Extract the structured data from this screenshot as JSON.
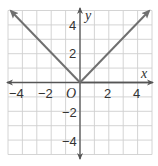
{
  "chart_data": {
    "type": "line",
    "title": "",
    "xlabel": "x",
    "ylabel": "y",
    "origin_label": "O",
    "xlim": [
      -5,
      5
    ],
    "ylim": [
      -5,
      5
    ],
    "grid": true,
    "x_ticks": [
      -4,
      -2,
      2,
      4
    ],
    "y_ticks": [
      4,
      2,
      -2,
      -4
    ],
    "x_tick_labels": [
      "−4",
      "−2",
      "2",
      "4"
    ],
    "y_tick_labels": [
      "4",
      "2",
      "−2",
      "−4"
    ],
    "series": [
      {
        "name": "y = |x|",
        "x": [
          -5,
          0,
          5
        ],
        "y": [
          5,
          0,
          5
        ],
        "color": "#707070",
        "arrows_at_ends": true
      }
    ],
    "colors": {
      "grid": "#cfcfcf",
      "axis": "#555555",
      "line": "#707070"
    }
  }
}
